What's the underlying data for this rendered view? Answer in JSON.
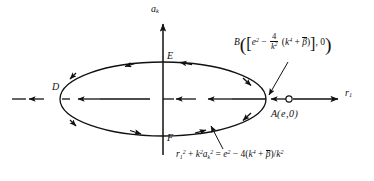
{
  "figure": {
    "type": "phase-plane-diagram",
    "background": "#ffffff",
    "stroke_color": "#111111",
    "axes": {
      "vertical": {
        "label": "a",
        "label_sub": "k",
        "x": 163,
        "y_top": 22,
        "y_bottom": 155
      },
      "horizontal": {
        "label": "r",
        "label_sub": "1",
        "y": 99,
        "x_left": 12,
        "x_right": 340
      }
    },
    "ellipse": {
      "cx": 163,
      "cy": 99,
      "rx": 103,
      "ry": 37,
      "equation_parts": {
        "lhs_r": "r",
        "lhs_r_sub": "1",
        "lhs_r_sup": "2",
        "plus": "+",
        "k_sym": "k",
        "k_sup": "2",
        "a_sym": "a",
        "a_sub": "k",
        "a_sup": "2",
        "equals": "=",
        "e_sym": "e",
        "e_sup": "2",
        "minus": "−",
        "four": "4(",
        "k4": "k",
        "k4_sup": "4",
        "plus2": "+",
        "beta": "β",
        "close": ")/",
        "k2": "k",
        "k2_sup": "2"
      }
    },
    "points": {
      "D": {
        "label": "D",
        "x": 52,
        "y": 83
      },
      "E": {
        "label": "E",
        "x": 167,
        "y": 52
      },
      "F": {
        "label": "F",
        "x": 167,
        "y": 134
      },
      "A": {
        "label_name": "A",
        "label_coords": "(e,0)",
        "x": 288,
        "y": 99,
        "marker": "open-circle"
      }
    },
    "annotations": {
      "B_label": {
        "name": "B",
        "e_sym": "e",
        "e_sup": "2",
        "minus": "−",
        "frac_num": "4",
        "frac_den_k": "k",
        "frac_den_sup": "2",
        "paren_k": "k",
        "paren_k_sup": "4",
        "plus": "+",
        "beta": "β",
        "tail": ", 0",
        "x": 240,
        "y": 40
      },
      "ellipse_eq": {
        "x": 178,
        "y": 155
      }
    }
  }
}
